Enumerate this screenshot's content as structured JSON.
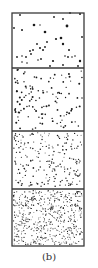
{
  "figure": {
    "caption": "(b)",
    "frame": {
      "x": 12,
      "y": 13,
      "width": 72,
      "height": 233,
      "stroke": "#3a3a3a",
      "stroke_width": 1.3
    },
    "dot_color": "#1a1a1a",
    "panels": [
      {
        "id": "panel-1",
        "label": "sparse",
        "y_top": 13,
        "y_bottom": 68,
        "dots": [
          [
            20,
            15,
            0.9
          ],
          [
            54,
            17,
            0.9
          ],
          [
            63,
            19,
            0.9
          ],
          [
            70,
            13,
            0.9
          ],
          [
            80,
            14,
            1.0
          ],
          [
            14,
            28,
            0.9
          ],
          [
            34,
            25,
            1.3
          ],
          [
            40,
            25,
            0.7
          ],
          [
            67,
            26,
            1.4
          ],
          [
            22,
            30,
            1.0
          ],
          [
            45,
            32,
            1.3
          ],
          [
            56,
            39,
            1.1
          ],
          [
            61,
            38,
            1.3
          ],
          [
            82,
            37,
            0.9
          ],
          [
            37,
            44,
            0.9
          ],
          [
            40,
            48,
            1.0
          ],
          [
            47,
            42,
            0.9
          ],
          [
            63,
            44,
            1.2
          ],
          [
            30,
            51,
            0.9
          ],
          [
            33,
            50,
            0.9
          ],
          [
            43,
            50,
            1.0
          ],
          [
            45,
            47,
            0.9
          ],
          [
            69,
            50,
            1.0
          ],
          [
            17,
            57,
            0.9
          ],
          [
            22,
            56,
            0.8
          ],
          [
            26,
            57,
            0.9
          ],
          [
            31,
            54,
            0.9
          ],
          [
            38,
            60,
            0.8
          ],
          [
            41,
            59,
            0.9
          ],
          [
            53,
            61,
            1.1
          ],
          [
            65,
            56,
            0.8
          ],
          [
            68,
            57,
            0.9
          ],
          [
            72,
            57,
            0.8
          ],
          [
            75,
            56,
            0.8
          ],
          [
            80,
            61,
            1.2
          ],
          [
            27,
            63,
            0.8
          ],
          [
            22,
            62,
            0.8
          ],
          [
            50,
            66,
            0.9
          ],
          [
            63,
            65,
            0.9
          ],
          [
            78,
            66,
            0.9
          ]
        ]
      },
      {
        "id": "panel-2",
        "label": "low-density",
        "y_top": 68,
        "y_bottom": 131,
        "count": 120,
        "radius": 0.75,
        "seed": 11
      },
      {
        "id": "panel-3",
        "label": "medium-density",
        "y_top": 131,
        "y_bottom": 189,
        "count": 210,
        "radius": 0.6,
        "seed": 29
      },
      {
        "id": "panel-4",
        "label": "high-density",
        "y_top": 189,
        "y_bottom": 246,
        "count": 520,
        "radius": 0.5,
        "seed": 47
      }
    ],
    "dividers_y": [
      68,
      131,
      189
    ]
  }
}
